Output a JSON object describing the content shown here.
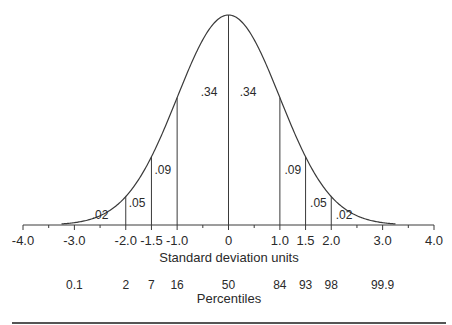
{
  "chart_data": {
    "type": "area",
    "title": "",
    "distribution": "standard normal",
    "xlabel": "Standard deviation units",
    "xlim": [
      -4.0,
      4.0
    ],
    "x_ticks": [
      {
        "value": -4.0,
        "label": "-4.0"
      },
      {
        "value": -3.0,
        "label": "-3.0"
      },
      {
        "value": -2.0,
        "label": "-2.0"
      },
      {
        "value": -1.5,
        "label": "-1.5"
      },
      {
        "value": -1.0,
        "label": "-1.0"
      },
      {
        "value": 0,
        "label": "0"
      },
      {
        "value": 1.0,
        "label": "1.0"
      },
      {
        "value": 1.5,
        "label": "1.5"
      },
      {
        "value": 2.0,
        "label": "2.0"
      },
      {
        "value": 3.0,
        "label": "3.0"
      },
      {
        "value": 4.0,
        "label": "4.0"
      }
    ],
    "minor_ticks": [
      -3.5,
      -2.5,
      -0.5,
      0.5,
      2.5,
      3.5
    ],
    "dividers": [
      -2.0,
      -1.5,
      -1.0,
      0,
      1.0,
      1.5,
      2.0
    ],
    "region_labels": [
      {
        "x": -2.0,
        "side": "left",
        "label": ".02"
      },
      {
        "x": -2.0,
        "side": "right",
        "label": ".05"
      },
      {
        "x": -1.5,
        "side": "right",
        "label": ".09"
      },
      {
        "x": -1.0,
        "side": "right",
        "label": ".34"
      },
      {
        "x": 0,
        "side": "right",
        "label": ".34"
      },
      {
        "x": 1.0,
        "side": "right",
        "label": ".09"
      },
      {
        "x": 1.5,
        "side": "right",
        "label": ".05"
      },
      {
        "x": 2.0,
        "side": "right",
        "label": ".02"
      }
    ],
    "percentiles_label": "Percentiles",
    "percentiles": [
      {
        "x": -3.0,
        "label": "0.1"
      },
      {
        "x": -2.0,
        "label": "2"
      },
      {
        "x": -1.5,
        "label": "7"
      },
      {
        "x": -1.0,
        "label": "16"
      },
      {
        "x": 0,
        "label": "50"
      },
      {
        "x": 1.0,
        "label": "84"
      },
      {
        "x": 1.5,
        "label": "93"
      },
      {
        "x": 2.0,
        "label": "98"
      },
      {
        "x": 3.0,
        "label": "99.9"
      }
    ]
  },
  "colors": {
    "line": "#3a3a3a",
    "text": "#2a2a2a",
    "rule": "#555555"
  }
}
